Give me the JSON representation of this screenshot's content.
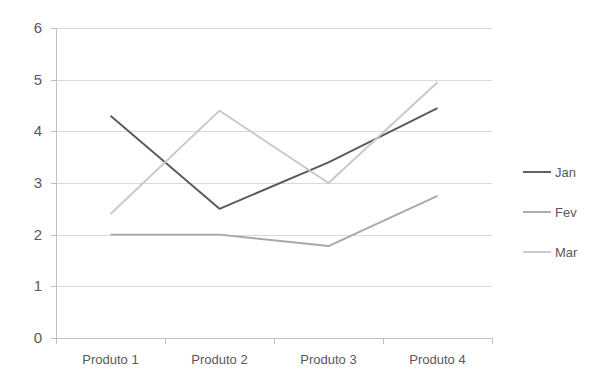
{
  "chart_data": {
    "type": "line",
    "title": "",
    "xlabel": "",
    "ylabel": "",
    "categories": [
      "Produto 1",
      "Produto 2",
      "Produto 3",
      "Produto 4"
    ],
    "ylim": [
      0,
      6
    ],
    "yticks": [
      0,
      1,
      2,
      3,
      4,
      5,
      6
    ],
    "ytick_labels": [
      "0",
      "1",
      "2",
      "3",
      "4",
      "5",
      "6"
    ],
    "grid": "horizontal",
    "legend_position": "right",
    "series": [
      {
        "name": "Jan",
        "color": "#58595b",
        "values": [
          4.3,
          2.5,
          3.4,
          4.45
        ]
      },
      {
        "name": "Fev",
        "color": "#a6a8ab",
        "values": [
          2.0,
          2.0,
          1.78,
          2.75
        ]
      },
      {
        "name": "Mar",
        "color": "#c7c8ca",
        "values": [
          2.4,
          4.4,
          3.0,
          4.95
        ]
      }
    ]
  },
  "legend": {
    "items": [
      {
        "label": "Jan"
      },
      {
        "label": "Fev"
      },
      {
        "label": "Mar"
      }
    ]
  }
}
